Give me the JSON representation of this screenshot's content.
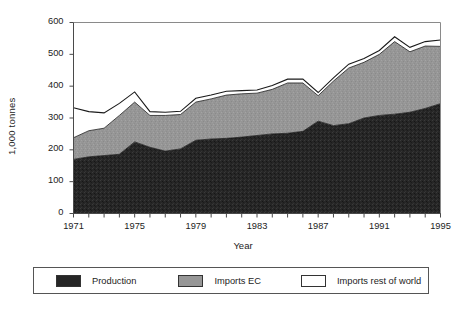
{
  "chart_data": {
    "type": "area",
    "stacked": true,
    "title": "",
    "subtitle": "",
    "xlabel": "Year",
    "ylabel": "1,000 tonnes",
    "xlim": [
      1971,
      1995
    ],
    "ylim": [
      0,
      600
    ],
    "yticks": [
      0,
      100,
      200,
      300,
      400,
      500,
      600
    ],
    "ytick_labels": [
      "0",
      "100",
      "200",
      "300",
      "400",
      "500",
      "600"
    ],
    "x": [
      1971,
      1972,
      1973,
      1974,
      1975,
      1976,
      1977,
      1978,
      1979,
      1980,
      1981,
      1982,
      1983,
      1984,
      1985,
      1986,
      1987,
      1988,
      1989,
      1990,
      1991,
      1992,
      1993,
      1994,
      1995
    ],
    "xtick_labels_shown": [
      "1971",
      "1975",
      "1979",
      "1983",
      "1987",
      "1991",
      "1995"
    ],
    "xticks_all_years": true,
    "grid": false,
    "legend_position": "bottom",
    "series": [
      {
        "name": "Production",
        "color": "#262626",
        "values": [
          170,
          178,
          182,
          186,
          225,
          208,
          196,
          203,
          230,
          234,
          236,
          240,
          245,
          250,
          252,
          258,
          290,
          276,
          282,
          300,
          308,
          312,
          318,
          330,
          345
        ]
      },
      {
        "name": "Imports EC",
        "color": "#969696",
        "values": [
          68,
          82,
          86,
          122,
          125,
          100,
          112,
          108,
          120,
          126,
          136,
          136,
          133,
          140,
          158,
          152,
          80,
          140,
          175,
          175,
          192,
          228,
          190,
          196,
          180
        ]
      },
      {
        "name": "Imports rest of world",
        "color": "#ffffff",
        "values": [
          94,
          60,
          48,
          38,
          32,
          12,
          10,
          10,
          12,
          12,
          12,
          10,
          10,
          12,
          12,
          12,
          10,
          10,
          12,
          12,
          12,
          15,
          14,
          14,
          20
        ]
      }
    ],
    "totals": [
      332,
      320,
      316,
      346,
      382,
      320,
      318,
      321,
      362,
      372,
      384,
      386,
      388,
      402,
      422,
      422,
      380,
      426,
      469,
      487,
      512,
      555,
      522,
      540,
      545
    ]
  },
  "legend": {
    "entries": [
      {
        "label": "Production",
        "swatch": "black-swatch"
      },
      {
        "label": "Imports EC",
        "swatch": "gray-swatch"
      },
      {
        "label": "Imports rest of world",
        "swatch": "white-swatch"
      }
    ]
  },
  "axes": {
    "y_title": "1,000 tonnes",
    "x_title": "Year"
  }
}
